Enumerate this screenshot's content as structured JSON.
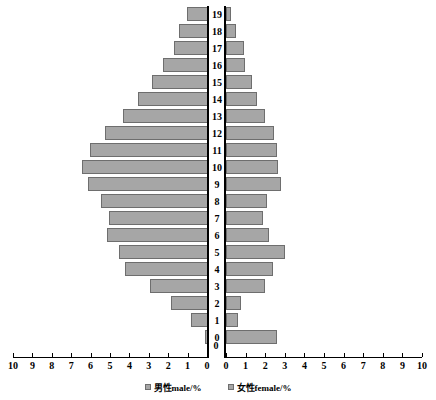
{
  "chart_data": {
    "type": "bar",
    "chart_subtype": "population-pyramid",
    "title": "",
    "xlabel": "",
    "ylabel": "",
    "orientation": "horizontal",
    "grid": false,
    "legend_position": "bottom",
    "axis": {
      "left_label": "男性male/%",
      "right_label": "女性female/%",
      "xlim_left": [
        10,
        0
      ],
      "xlim_right": [
        0,
        10
      ],
      "xticks_left": [
        "10",
        "9",
        "8",
        "7",
        "6",
        "5",
        "4",
        "3",
        "2",
        "1",
        "0"
      ],
      "xticks_right": [
        "0",
        "1",
        "2",
        "3",
        "4",
        "5",
        "6",
        "7",
        "8",
        "9",
        "10"
      ],
      "xtick_values": [
        0,
        1,
        2,
        3,
        4,
        5,
        6,
        7,
        8,
        9,
        10
      ],
      "center_zero_label": "0",
      "ylim": [
        0,
        19
      ]
    },
    "categories": [
      "0",
      "1",
      "2",
      "3",
      "4",
      "5",
      "6",
      "7",
      "8",
      "9",
      "10",
      "11",
      "12",
      "13",
      "14",
      "15",
      "16",
      "17",
      "18",
      "19"
    ],
    "series": [
      {
        "name": "男性male/%",
        "side": "left",
        "values": [
          0.15,
          0.9,
          1.9,
          3.0,
          4.3,
          4.6,
          5.2,
          5.1,
          5.5,
          6.2,
          6.5,
          6.1,
          5.3,
          4.4,
          3.6,
          2.9,
          2.3,
          1.75,
          1.5,
          1.1
        ]
      },
      {
        "name": "女性female/%",
        "side": "right",
        "values": [
          2.6,
          0.6,
          0.75,
          2.0,
          2.4,
          3.0,
          2.2,
          1.9,
          2.1,
          2.8,
          2.65,
          2.6,
          2.45,
          2.0,
          1.6,
          1.35,
          0.95,
          0.9,
          0.5,
          0.25
        ]
      }
    ],
    "colors": {
      "bar_fill": "#a6a6a6",
      "bar_border": "#6e6e6e",
      "axis": "#000000",
      "background": "#ffffff"
    }
  },
  "legend": {
    "items": [
      {
        "label": "男性male/%"
      },
      {
        "label": "女性female/%"
      }
    ]
  }
}
